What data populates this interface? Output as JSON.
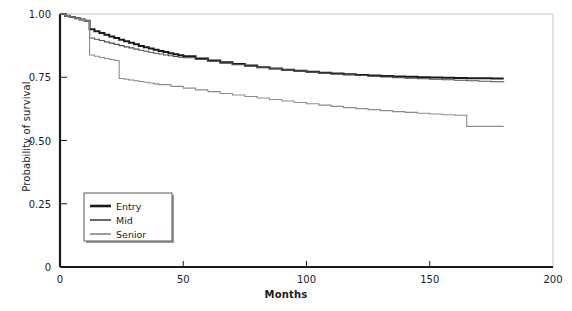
{
  "chart_data": {
    "type": "line",
    "title": "",
    "subtitle": "",
    "xlabel": "Months",
    "ylabel": "Probability of survival",
    "xlim": [
      0,
      200
    ],
    "ylim": [
      0,
      1.0
    ],
    "xticks": [
      0,
      50,
      100,
      150,
      200
    ],
    "xtick_labels": [
      "0",
      "50",
      "100",
      "150",
      "200"
    ],
    "yticks": [
      0,
      0.25,
      0.5,
      0.75,
      1.0
    ],
    "ytick_labels": [
      "0",
      "0.25",
      "0.50",
      "0.75",
      "1.00"
    ],
    "grid": false,
    "legend_position": "lower left",
    "legend_entries": [
      "Entry",
      "Mid",
      "Senior"
    ],
    "series": [
      {
        "name": "Entry",
        "color": "#1a1a1a",
        "line_width": 2.0,
        "x": [
          0,
          2,
          4,
          6,
          8,
          10,
          12,
          12,
          14,
          16,
          18,
          20,
          22,
          24,
          26,
          28,
          30,
          32,
          34,
          36,
          38,
          40,
          42,
          44,
          46,
          48,
          50,
          55,
          60,
          65,
          70,
          75,
          80,
          85,
          90,
          95,
          100,
          105,
          110,
          115,
          120,
          125,
          130,
          135,
          140,
          145,
          150,
          155,
          160,
          165,
          170,
          175,
          180
        ],
        "y": [
          1.0,
          0.993,
          0.988,
          0.983,
          0.978,
          0.973,
          0.968,
          0.94,
          0.932,
          0.925,
          0.918,
          0.911,
          0.905,
          0.898,
          0.892,
          0.886,
          0.88,
          0.874,
          0.869,
          0.864,
          0.859,
          0.854,
          0.85,
          0.845,
          0.841,
          0.837,
          0.833,
          0.824,
          0.816,
          0.809,
          0.802,
          0.796,
          0.79,
          0.785,
          0.78,
          0.776,
          0.772,
          0.768,
          0.765,
          0.762,
          0.759,
          0.757,
          0.755,
          0.753,
          0.752,
          0.75,
          0.749,
          0.748,
          0.747,
          0.746,
          0.746,
          0.745,
          0.745
        ]
      },
      {
        "name": "Mid",
        "color": "#4d4d4d",
        "line_width": 1.1,
        "x": [
          0,
          2,
          4,
          6,
          8,
          10,
          12,
          12,
          14,
          16,
          18,
          20,
          22,
          24,
          26,
          28,
          30,
          32,
          34,
          36,
          38,
          40,
          42,
          44,
          46,
          48,
          50,
          55,
          60,
          65,
          70,
          75,
          80,
          85,
          90,
          95,
          100,
          105,
          110,
          115,
          120,
          125,
          130,
          135,
          140,
          145,
          150,
          155,
          160,
          165,
          170,
          175,
          180
        ],
        "y": [
          1.0,
          0.993,
          0.988,
          0.983,
          0.978,
          0.973,
          0.968,
          0.905,
          0.9,
          0.895,
          0.89,
          0.885,
          0.88,
          0.875,
          0.87,
          0.866,
          0.861,
          0.857,
          0.853,
          0.849,
          0.845,
          0.842,
          0.838,
          0.835,
          0.832,
          0.829,
          0.827,
          0.82,
          0.813,
          0.806,
          0.8,
          0.794,
          0.789,
          0.784,
          0.779,
          0.775,
          0.771,
          0.767,
          0.763,
          0.76,
          0.757,
          0.754,
          0.751,
          0.748,
          0.746,
          0.744,
          0.742,
          0.74,
          0.738,
          0.736,
          0.734,
          0.732,
          0.73
        ]
      },
      {
        "name": "Senior",
        "color": "#8c8c8c",
        "line_width": 1.1,
        "x": [
          0,
          2,
          4,
          6,
          8,
          10,
          12,
          12,
          14,
          16,
          18,
          20,
          22,
          24,
          24,
          26,
          28,
          30,
          32,
          34,
          36,
          38,
          40,
          45,
          50,
          55,
          60,
          65,
          70,
          75,
          80,
          85,
          90,
          95,
          100,
          105,
          110,
          115,
          120,
          125,
          130,
          135,
          140,
          145,
          150,
          155,
          160,
          165,
          165,
          170,
          175,
          180
        ],
        "y": [
          1.0,
          0.993,
          0.988,
          0.983,
          0.978,
          0.973,
          0.968,
          0.838,
          0.833,
          0.828,
          0.824,
          0.82,
          0.816,
          0.812,
          0.745,
          0.742,
          0.739,
          0.736,
          0.733,
          0.73,
          0.727,
          0.724,
          0.721,
          0.714,
          0.707,
          0.7,
          0.693,
          0.686,
          0.68,
          0.674,
          0.668,
          0.662,
          0.656,
          0.65,
          0.645,
          0.64,
          0.635,
          0.63,
          0.626,
          0.622,
          0.618,
          0.614,
          0.611,
          0.608,
          0.605,
          0.602,
          0.6,
          0.598,
          0.556,
          0.556,
          0.556,
          0.556
        ]
      }
    ]
  },
  "axes": {
    "x_title": "Months",
    "y_title": "Probability of survival"
  },
  "legend": {
    "items": [
      {
        "label": "Entry"
      },
      {
        "label": "Mid"
      },
      {
        "label": "Senior"
      }
    ]
  },
  "colors": {
    "axis": "#1a1a1a",
    "frame": "#c8c8c8",
    "background": "#ffffff"
  }
}
